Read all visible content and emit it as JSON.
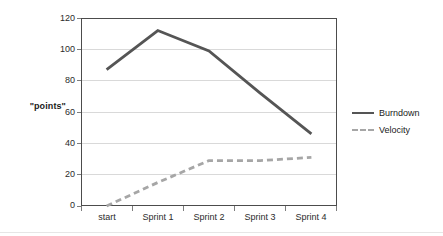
{
  "chart_data": {
    "type": "line",
    "title": "",
    "subtitle": "",
    "xlabel": "",
    "ylabel": "\"points\"",
    "categories": [
      "start",
      "Sprint 1",
      "Sprint 2",
      "Sprint 3",
      "Sprint 4"
    ],
    "series": [
      {
        "name": "Burndown",
        "values": [
          87,
          112,
          99,
          72,
          46
        ],
        "style": "solid",
        "color": "#555555",
        "width": 2.8
      },
      {
        "name": "Velocity",
        "values": [
          0,
          15,
          29,
          29,
          31
        ],
        "style": "dashed",
        "color": "#a6a6a6",
        "width": 2.8
      }
    ],
    "ylim": [
      0,
      120
    ],
    "y_ticks": [
      0,
      20,
      40,
      60,
      80,
      100,
      120
    ],
    "y_tick_labels": [
      "0",
      "20",
      "40",
      "60",
      "80",
      "100",
      "120"
    ],
    "grid": true,
    "grid_axis": "y",
    "grid_color": "#d9d9d9",
    "legend_position": "right",
    "legend_entries": [
      "Burndown",
      "Velocity"
    ],
    "frame_color": "#4c4c4c",
    "background": "#ffffff"
  },
  "axes": {
    "y_title": "\"points\"",
    "y_tick_0": "0",
    "y_tick_1": "20",
    "y_tick_2": "40",
    "y_tick_3": "60",
    "y_tick_4": "80",
    "y_tick_5": "100",
    "y_tick_6": "120",
    "x_tick_0": "start",
    "x_tick_1": "Sprint 1",
    "x_tick_2": "Sprint 2",
    "x_tick_3": "Sprint 3",
    "x_tick_4": "Sprint 4"
  },
  "legend": {
    "burndown_label": "Burndown",
    "velocity_label": "Velocity"
  }
}
